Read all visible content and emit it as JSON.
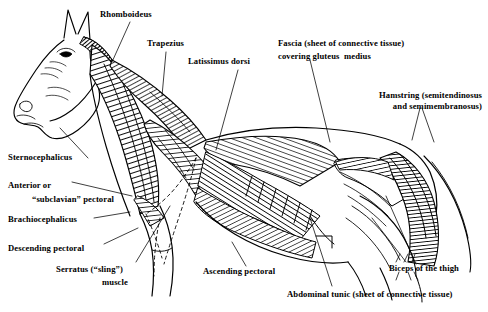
{
  "figure": {
    "view": "left lateral profile",
    "style": "pen-and-ink line engraving with directional hatching",
    "background_color": "#ffffff",
    "ink_color": "#000000"
  },
  "labels": [
    {
      "id": "rhomboideus",
      "text": "Rhomboideus"
    },
    {
      "id": "trapezius",
      "text": "Trapezius"
    },
    {
      "id": "latissimus-dorsi",
      "text": "Latissimus dorsi"
    },
    {
      "id": "fascia-gluteus-l1",
      "text": "Fascia (sheet of connective tissue)"
    },
    {
      "id": "fascia-gluteus-l2",
      "text": "covering gluteus  medius"
    },
    {
      "id": "hamstring-l1",
      "text": "Hamstring (semitendinosus"
    },
    {
      "id": "hamstring-l2",
      "text": "and semimembranosus)"
    },
    {
      "id": "sternocephalicus",
      "text": "Sternocephalicus"
    },
    {
      "id": "anterior-pectoral-l1",
      "text": "Anterior or"
    },
    {
      "id": "anterior-pectoral-l2",
      "text": "“subclavian” pectoral"
    },
    {
      "id": "brachiocephalicus",
      "text": "Brachiocephalicus"
    },
    {
      "id": "descending-pectoral",
      "text": "Descending pectoral"
    },
    {
      "id": "serratus-l1",
      "text": "Serratus (“sling”)"
    },
    {
      "id": "serratus-l2",
      "text": "muscle"
    },
    {
      "id": "ascending-pectoral",
      "text": "Ascending pectoral"
    },
    {
      "id": "biceps-thigh",
      "text": "Biceps of the thigh"
    },
    {
      "id": "abdominal-tunic",
      "text": "Abdominal tunic (sheet of connective tissue)"
    }
  ]
}
